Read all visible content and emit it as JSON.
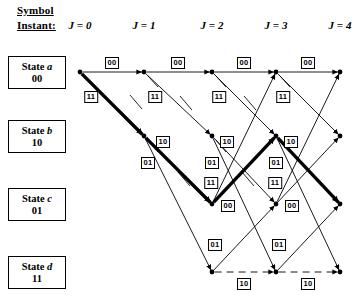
{
  "header": {
    "symbol_label": "Symbol",
    "instant_label": "Instant:",
    "columns": [
      {
        "id": "j0",
        "label": "J = 0",
        "x": 80
      },
      {
        "id": "j1",
        "label": "J = 1",
        "x": 144
      },
      {
        "id": "j2",
        "label": "J = 2",
        "x": 212
      },
      {
        "id": "j3",
        "label": "J = 3",
        "x": 276
      },
      {
        "id": "j4",
        "label": "J = 4",
        "x": 340
      }
    ]
  },
  "states": [
    {
      "id": "a",
      "name": "State a",
      "bits": "00",
      "y": 72
    },
    {
      "id": "b",
      "name": "State b",
      "bits": "10",
      "y": 136
    },
    {
      "id": "c",
      "name": "State c",
      "bits": "01",
      "y": 204
    },
    {
      "id": "d",
      "name": "State d",
      "bits": "11",
      "y": 272
    }
  ],
  "chart_data": {
    "type": "diagram",
    "xlabel": "Symbol Instant",
    "ylabel": "State",
    "columns_x": [
      80,
      144,
      212,
      276,
      340
    ],
    "rows_y": {
      "a": 72,
      "b": 136,
      "c": 204,
      "d": 272
    },
    "node_radius": 2.4,
    "branch_outputs": {
      "a_to_a": "00",
      "a_to_b": "11",
      "b_to_c": "10",
      "b_to_d": "01",
      "c_to_a": "11",
      "c_to_b": "00",
      "d_to_c": "01",
      "d_to_d": "10"
    },
    "nodes": [
      {
        "col": 0,
        "state": "a"
      },
      {
        "col": 1,
        "state": "a"
      },
      {
        "col": 1,
        "state": "b"
      },
      {
        "col": 2,
        "state": "a"
      },
      {
        "col": 2,
        "state": "b"
      },
      {
        "col": 2,
        "state": "c"
      },
      {
        "col": 2,
        "state": "d"
      },
      {
        "col": 3,
        "state": "a"
      },
      {
        "col": 3,
        "state": "b"
      },
      {
        "col": 3,
        "state": "c"
      },
      {
        "col": 3,
        "state": "d"
      },
      {
        "col": 4,
        "state": "a"
      },
      {
        "col": 4,
        "state": "b"
      },
      {
        "col": 4,
        "state": "c"
      },
      {
        "col": 4,
        "state": "d"
      }
    ],
    "edges": [
      {
        "from_col": 0,
        "from": "a",
        "to_col": 1,
        "to": "a",
        "output": "00",
        "style": "solid",
        "weight": "thin",
        "arrow": true
      },
      {
        "from_col": 1,
        "from": "a",
        "to_col": 2,
        "to": "a",
        "output": "00",
        "style": "solid",
        "weight": "thin",
        "arrow": true
      },
      {
        "from_col": 2,
        "from": "a",
        "to_col": 3,
        "to": "a",
        "output": "00",
        "style": "solid",
        "weight": "thin",
        "arrow": true
      },
      {
        "from_col": 3,
        "from": "a",
        "to_col": 4,
        "to": "a",
        "output": "00",
        "style": "solid",
        "weight": "thin",
        "arrow": true
      },
      {
        "from_col": 0,
        "from": "a",
        "to_col": 1,
        "to": "b",
        "output": "11",
        "style": "solid",
        "weight": "bold",
        "arrow": true
      },
      {
        "from_col": 1,
        "from": "a",
        "to_col": 2,
        "to": "b",
        "output": "11",
        "style": "solid",
        "weight": "thin",
        "arrow": true
      },
      {
        "from_col": 2,
        "from": "a",
        "to_col": 3,
        "to": "b",
        "output": "11",
        "style": "solid",
        "weight": "thin",
        "arrow": true
      },
      {
        "from_col": 3,
        "from": "a",
        "to_col": 4,
        "to": "b",
        "output": "11",
        "style": "solid",
        "weight": "thin",
        "arrow": true
      },
      {
        "from_col": 1,
        "from": "b",
        "to_col": 2,
        "to": "c",
        "output": "10",
        "style": "solid",
        "weight": "bold",
        "arrow": true
      },
      {
        "from_col": 2,
        "from": "b",
        "to_col": 3,
        "to": "c",
        "output": "10",
        "style": "solid",
        "weight": "thin",
        "arrow": true
      },
      {
        "from_col": 3,
        "from": "b",
        "to_col": 4,
        "to": "c",
        "output": "10",
        "style": "solid",
        "weight": "bold",
        "arrow": true
      },
      {
        "from_col": 1,
        "from": "b",
        "to_col": 2,
        "to": "d",
        "output": "01",
        "style": "solid",
        "weight": "thin",
        "arrow": true
      },
      {
        "from_col": 2,
        "from": "b",
        "to_col": 3,
        "to": "d",
        "output": "01",
        "style": "solid",
        "weight": "thin",
        "arrow": true
      },
      {
        "from_col": 3,
        "from": "b",
        "to_col": 4,
        "to": "d",
        "output": "01",
        "style": "solid",
        "weight": "thin",
        "arrow": true
      },
      {
        "from_col": 2,
        "from": "c",
        "to_col": 3,
        "to": "a",
        "output": "11",
        "style": "solid",
        "weight": "thin",
        "arrow": true
      },
      {
        "from_col": 3,
        "from": "c",
        "to_col": 4,
        "to": "a",
        "output": "11",
        "style": "solid",
        "weight": "thin",
        "arrow": true
      },
      {
        "from_col": 2,
        "from": "c",
        "to_col": 3,
        "to": "b",
        "output": "00",
        "style": "solid",
        "weight": "bold",
        "arrow": true
      },
      {
        "from_col": 3,
        "from": "c",
        "to_col": 4,
        "to": "b",
        "output": "00",
        "style": "solid",
        "weight": "thin",
        "arrow": true
      },
      {
        "from_col": 2,
        "from": "d",
        "to_col": 3,
        "to": "c",
        "output": "01",
        "style": "solid",
        "weight": "thin",
        "arrow": true
      },
      {
        "from_col": 3,
        "from": "d",
        "to_col": 4,
        "to": "c",
        "output": "01",
        "style": "solid",
        "weight": "thin",
        "arrow": true
      },
      {
        "from_col": 2,
        "from": "d",
        "to_col": 3,
        "to": "d",
        "output": "10",
        "style": "dashed",
        "weight": "thin",
        "arrow": true
      },
      {
        "from_col": 3,
        "from": "d",
        "to_col": 4,
        "to": "d",
        "output": "10",
        "style": "dashed",
        "weight": "thin",
        "arrow": true
      }
    ],
    "survivor_path": {
      "description": "Bold survivor path",
      "sequence": [
        "a",
        "b",
        "c",
        "b",
        "c"
      ],
      "outputs": [
        "11",
        "10",
        "00",
        "10"
      ]
    },
    "edge_labels": [
      {
        "text": "00",
        "x": 112,
        "y": 63
      },
      {
        "text": "00",
        "x": 178,
        "y": 63
      },
      {
        "text": "00",
        "x": 244,
        "y": 63
      },
      {
        "text": "00",
        "x": 308,
        "y": 63
      },
      {
        "text": "11",
        "x": 91,
        "y": 97
      },
      {
        "text": "11",
        "x": 155,
        "y": 97
      },
      {
        "text": "11",
        "x": 219,
        "y": 97
      },
      {
        "text": "11",
        "x": 283,
        "y": 97
      },
      {
        "text": "10",
        "x": 163,
        "y": 142
      },
      {
        "text": "10",
        "x": 227,
        "y": 142
      },
      {
        "text": "10",
        "x": 291,
        "y": 142
      },
      {
        "text": "01",
        "x": 148,
        "y": 163
      },
      {
        "text": "01",
        "x": 212,
        "y": 163
      },
      {
        "text": "01",
        "x": 276,
        "y": 163
      },
      {
        "text": "11",
        "x": 211,
        "y": 183
      },
      {
        "text": "11",
        "x": 275,
        "y": 183
      },
      {
        "text": "00",
        "x": 228,
        "y": 206
      },
      {
        "text": "00",
        "x": 292,
        "y": 206
      },
      {
        "text": "01",
        "x": 215,
        "y": 245
      },
      {
        "text": "01",
        "x": 279,
        "y": 245
      },
      {
        "text": "10",
        "x": 244,
        "y": 284
      },
      {
        "text": "10",
        "x": 308,
        "y": 284
      }
    ],
    "stubs": [
      {
        "x1": 148,
        "y1": 76,
        "x2": 158,
        "y2": 87
      },
      {
        "x1": 216,
        "y1": 76,
        "x2": 226,
        "y2": 87
      },
      {
        "x1": 280,
        "y1": 76,
        "x2": 290,
        "y2": 87
      },
      {
        "x1": 130,
        "y1": 95,
        "x2": 142,
        "y2": 109
      },
      {
        "x1": 180,
        "y1": 96,
        "x2": 192,
        "y2": 110
      },
      {
        "x1": 244,
        "y1": 96,
        "x2": 256,
        "y2": 110
      },
      {
        "x1": 148,
        "y1": 140,
        "x2": 158,
        "y2": 152
      },
      {
        "x1": 216,
        "y1": 140,
        "x2": 226,
        "y2": 152
      },
      {
        "x1": 280,
        "y1": 140,
        "x2": 290,
        "y2": 152
      },
      {
        "x1": 178,
        "y1": 172,
        "x2": 190,
        "y2": 186
      },
      {
        "x1": 242,
        "y1": 172,
        "x2": 254,
        "y2": 186
      }
    ]
  }
}
